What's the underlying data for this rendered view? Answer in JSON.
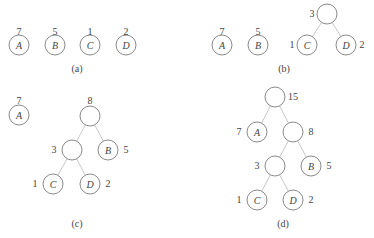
{
  "figure": {
    "panels": [
      {
        "caption": "(a)",
        "caption_pos": [
          77,
          72
        ],
        "edges": [],
        "nodes": [
          {
            "letter": "A",
            "weight": "7",
            "cx": 19,
            "cy": 45,
            "wx": 19,
            "wy": 35
          },
          {
            "letter": "B",
            "weight": "5",
            "cx": 55,
            "cy": 45,
            "wx": 55,
            "wy": 35
          },
          {
            "letter": "C",
            "weight": "1",
            "cx": 90,
            "cy": 45,
            "wx": 90,
            "wy": 35
          },
          {
            "letter": "D",
            "weight": "2",
            "cx": 126,
            "cy": 45,
            "wx": 126,
            "wy": 35
          }
        ]
      },
      {
        "caption": "(b)",
        "caption_pos": [
          284,
          72
        ],
        "edges": [
          [
            327,
            14,
            307,
            45
          ],
          [
            327,
            14,
            346,
            45
          ]
        ],
        "nodes": [
          {
            "letter": "A",
            "weight": "7",
            "cx": 222,
            "cy": 45,
            "wx": 222,
            "wy": 35
          },
          {
            "letter": "B",
            "weight": "5",
            "cx": 258,
            "cy": 45,
            "wx": 258,
            "wy": 35
          },
          {
            "letter": "",
            "weight": "3",
            "cx": 327,
            "cy": 14,
            "wx": 312,
            "wy": 17
          },
          {
            "letter": "C",
            "weight": "1",
            "cx": 307,
            "cy": 45,
            "wx": 292,
            "wy": 48
          },
          {
            "letter": "D",
            "weight": "2",
            "cx": 346,
            "cy": 45,
            "wx": 362,
            "wy": 48
          }
        ]
      },
      {
        "caption": "(c)",
        "caption_pos": [
          77,
          227
        ],
        "edges": [
          [
            90,
            116,
            72,
            150
          ],
          [
            90,
            116,
            108,
            150
          ],
          [
            72,
            150,
            53,
            184
          ],
          [
            72,
            150,
            90,
            184
          ]
        ],
        "nodes": [
          {
            "letter": "A",
            "weight": "7",
            "cx": 19,
            "cy": 115,
            "wx": 19,
            "wy": 104
          },
          {
            "letter": "",
            "weight": "8",
            "cx": 90,
            "cy": 116,
            "wx": 90,
            "wy": 104
          },
          {
            "letter": "",
            "weight": "3",
            "cx": 72,
            "cy": 150,
            "wx": 54,
            "wy": 153
          },
          {
            "letter": "B",
            "weight": "5",
            "cx": 108,
            "cy": 150,
            "wx": 126,
            "wy": 153
          },
          {
            "letter": "C",
            "weight": "1",
            "cx": 53,
            "cy": 184,
            "wx": 35,
            "wy": 187
          },
          {
            "letter": "D",
            "weight": "2",
            "cx": 90,
            "cy": 184,
            "wx": 108,
            "wy": 187
          }
        ]
      },
      {
        "caption": "(d)",
        "caption_pos": [
          283,
          227
        ],
        "edges": [
          [
            275,
            97,
            257,
            132
          ],
          [
            275,
            97,
            293,
            132
          ],
          [
            293,
            132,
            275,
            166
          ],
          [
            293,
            132,
            311,
            166
          ],
          [
            275,
            166,
            257,
            200
          ],
          [
            275,
            166,
            293,
            200
          ]
        ],
        "nodes": [
          {
            "letter": "",
            "weight": "15",
            "cx": 275,
            "cy": 97,
            "wx": 293,
            "wy": 100
          },
          {
            "letter": "A",
            "weight": "7",
            "cx": 257,
            "cy": 132,
            "wx": 239,
            "wy": 135
          },
          {
            "letter": "",
            "weight": "8",
            "cx": 293,
            "cy": 132,
            "wx": 311,
            "wy": 135
          },
          {
            "letter": "",
            "weight": "3",
            "cx": 275,
            "cy": 166,
            "wx": 257,
            "wy": 169
          },
          {
            "letter": "B",
            "weight": "5",
            "cx": 311,
            "cy": 166,
            "wx": 329,
            "wy": 169
          },
          {
            "letter": "C",
            "weight": "1",
            "cx": 257,
            "cy": 200,
            "wx": 239,
            "wy": 203
          },
          {
            "letter": "D",
            "weight": "2",
            "cx": 293,
            "cy": 200,
            "wx": 311,
            "wy": 203
          }
        ]
      }
    ],
    "node_radius": 10
  }
}
